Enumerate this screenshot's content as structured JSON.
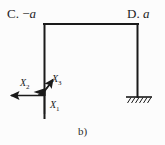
{
  "figure": {
    "caption": "b)",
    "options": [
      {
        "id": "c",
        "text": "C. −",
        "variable": "a"
      },
      {
        "id": "d",
        "text": "D. ",
        "variable": "a"
      }
    ],
    "force_labels": [
      {
        "id": "x1",
        "symbol": "X",
        "subscript": "1",
        "direction": "up"
      },
      {
        "id": "x2",
        "symbol": "X",
        "subscript": "2",
        "direction": "left"
      },
      {
        "id": "x3",
        "symbol": "X",
        "subscript": "3",
        "direction": "up-right"
      }
    ],
    "colors": {
      "line": "#1a1a1a",
      "background": "#fcfcfc",
      "text": "#232323"
    },
    "geometry": {
      "top_beam_y": 24,
      "left_column_x": 44,
      "right_column_x": 138,
      "left_column_bottom_y": 118,
      "support_y": 97,
      "support_left_x": 126,
      "support_right_x": 152
    }
  }
}
